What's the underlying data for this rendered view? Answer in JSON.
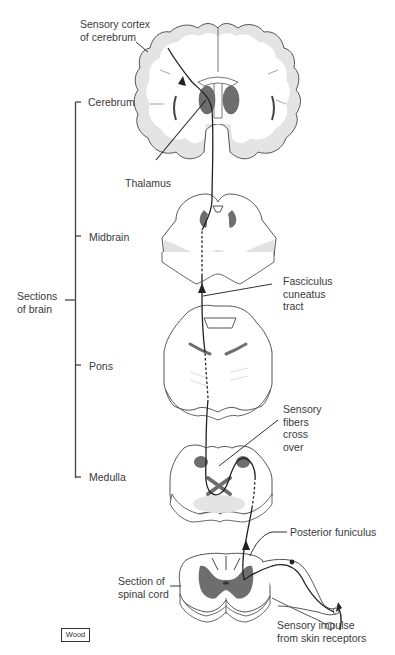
{
  "figure": {
    "credit": "Wood"
  },
  "labels": {
    "sensory_cortex": [
      "Sensory cortex",
      "of cerebrum"
    ],
    "thalamus": "Thalamus",
    "fasciculus": [
      "Fasciculus",
      "cuneatus",
      "tract"
    ],
    "sensory_fibers": [
      "Sensory",
      "fibers",
      "cross",
      "over"
    ],
    "posterior_funiculus": "Posterior funiculus",
    "section_spinal": [
      "Section of",
      "spinal cord"
    ],
    "sensory_impulse": [
      "Sensory impulse",
      "from skin receptors"
    ],
    "sections_of_brain": [
      "Sections",
      "of brain"
    ]
  },
  "bracket": {
    "items": [
      {
        "label": "Cerebrum"
      },
      {
        "label": "Midbrain"
      },
      {
        "label": "Pons"
      },
      {
        "label": "Medulla"
      }
    ]
  },
  "colors": {
    "outline": "#555555",
    "white_matter": "#ffffff",
    "cortex_gray": "#e2e2e2",
    "nucleus_dark": "#6e6e6e",
    "pathway": "#222222"
  }
}
